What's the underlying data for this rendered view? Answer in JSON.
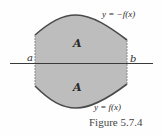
{
  "figure": {
    "caption": "Figure 5.7.4",
    "colors": {
      "region_fill": "#bdbdbd",
      "curve_stroke": "#4a4a4a",
      "axis_stroke": "#3a3a3a",
      "edge_stroke": "#8a8a8a"
    },
    "region_labels": {
      "upper": "A",
      "lower": "A"
    },
    "endpoints": {
      "left": "a",
      "right": "b"
    },
    "curves": {
      "upper": "y = −f(x)",
      "lower": "y = f(x)"
    }
  }
}
